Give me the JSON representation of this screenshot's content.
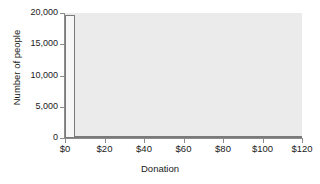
{
  "chart_data": {
    "type": "bar",
    "title": "",
    "subtitle": "",
    "xlabel": "Donation",
    "ylabel": "Number of people",
    "xlim": [
      0,
      120
    ],
    "ylim": [
      0,
      20000
    ],
    "grid": false,
    "legend": null,
    "x_tick_labels": [
      "$0",
      "$20",
      "$40",
      "$60",
      "$80",
      "$100",
      "$120"
    ],
    "x_tick_values": [
      0,
      20,
      40,
      60,
      80,
      100,
      120
    ],
    "y_tick_labels": [
      "0",
      "5,000",
      "10,000",
      "15,000",
      "20,000"
    ],
    "y_tick_values": [
      0,
      5000,
      10000,
      15000,
      20000
    ],
    "bin_width": 5,
    "categories": [
      "0-5",
      "5-10",
      "10-15",
      "15-20",
      "20-25",
      "25-30",
      "30-35",
      "35-40",
      "40-45",
      "45-50",
      "50-55",
      "55-60",
      "60-65",
      "65-70",
      "70-75",
      "75-80",
      "80-85",
      "85-90",
      "90-95",
      "95-100",
      "100-105",
      "105-110",
      "110-115",
      "115-120"
    ],
    "values": [
      19700,
      170,
      180,
      130,
      230,
      140,
      30,
      10,
      10,
      5,
      5,
      5,
      5,
      3,
      3,
      3,
      2,
      2,
      2,
      2,
      2,
      2,
      2,
      2
    ],
    "bar_fill_color": "#f7f7f7",
    "bar_edge_color": "#7a7a7a",
    "plot_background_color": "#ebebeb",
    "axis_color": "#8c8c8c",
    "text_color": "#1a1a1a"
  }
}
